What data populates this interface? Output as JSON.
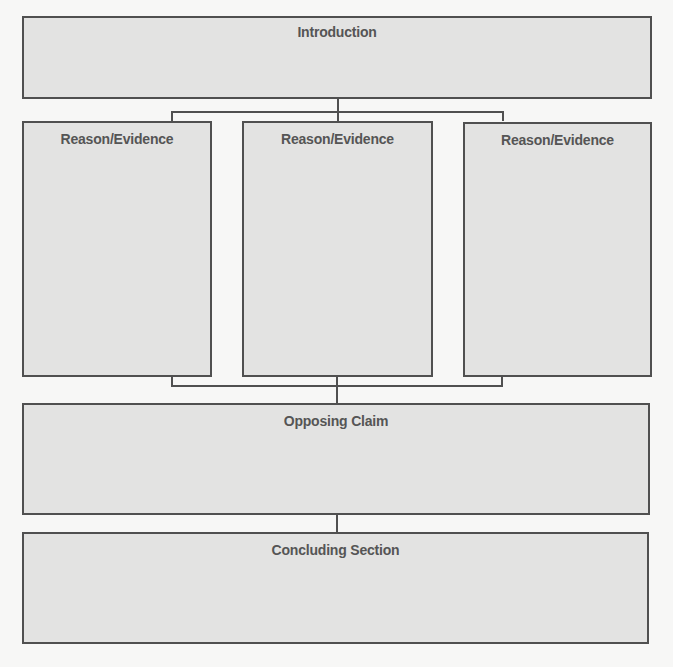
{
  "diagram": {
    "type": "argumentative-essay-organizer",
    "colors": {
      "box_fill": "#e3e3e2",
      "border": "#505050",
      "text": "#555555",
      "background": "#f7f7f6"
    },
    "introduction": {
      "title": "Introduction"
    },
    "reasons": [
      {
        "title": "Reason/Evidence"
      },
      {
        "title": "Reason/Evidence"
      },
      {
        "title": "Reason/Evidence"
      }
    ],
    "opposing_claim": {
      "title": "Opposing Claim"
    },
    "conclusion": {
      "title": "Concluding Section"
    }
  }
}
